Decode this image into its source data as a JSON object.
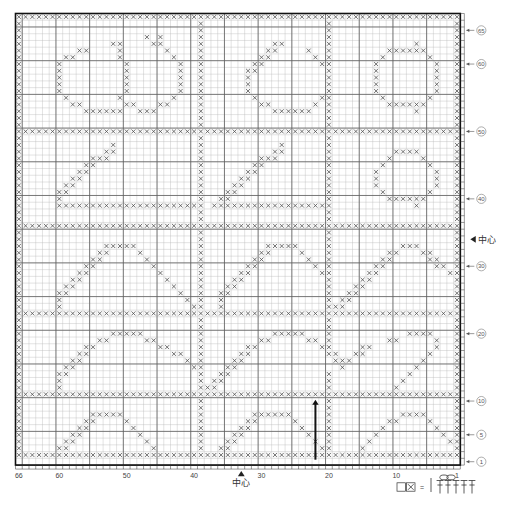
{
  "title": "",
  "chart_data": {
    "type": "heatmap",
    "xlabel": "",
    "ylabel": "",
    "grid": true,
    "cols": 66,
    "rows": 67,
    "col_numbering": "right-to-left",
    "row_numbering": "bottom-to-top",
    "major_gridline_every": 5,
    "cell_symbol": "x",
    "x_ticks": [
      {
        "col": 66,
        "label": "66"
      },
      {
        "col": 60,
        "label": "60"
      },
      {
        "col": 50,
        "label": "50"
      },
      {
        "col": 40,
        "label": "40"
      },
      {
        "col": 30,
        "label": "30"
      },
      {
        "col": 20,
        "label": "20"
      },
      {
        "col": 10,
        "label": "10"
      },
      {
        "col": 1,
        "label": "1"
      }
    ],
    "y_ticks": [
      {
        "row": 65,
        "label": "65"
      },
      {
        "row": 60,
        "label": "60"
      },
      {
        "row": 50,
        "label": "50"
      },
      {
        "row": 40,
        "label": "40"
      },
      {
        "row": 30,
        "label": "30"
      },
      {
        "row": 20,
        "label": "20"
      },
      {
        "row": 10,
        "label": "10"
      },
      {
        "row": 5,
        "label": "5"
      },
      {
        "row": 1,
        "label": "1"
      }
    ],
    "center_markers": [
      {
        "axis": "x",
        "col": 33,
        "label": "中心"
      },
      {
        "axis": "y",
        "row": 34,
        "label": "中心"
      }
    ],
    "start_arrow": {
      "col": 22,
      "label": "start",
      "direction": "up"
    },
    "rows_data": [
      "111111111111111111111111111111111111111111111111111111111111111111",
      "100000000000000000000000000100000000000000000010000000000000000001",
      "100000000000000000000000000100000000000000000010000000000000000001",
      "100000000000000000010100000100000000000000000010000000000000000001",
      "100000000000001100001100000100000000001100000010000000000001000001",
      "100000000110000100000010000100000000011000010010000000011111100001",
      "100000011000000100000001000100000000110000001010000000100000010001",
      "100000100000000010000000100100000001100000000110000001000000001001",
      "100000100000000010000000100100000011000000000010000001000000001001",
      "100000100000000010000000100100000010000000000010000001000000001001",
      "100000100000000010000000100100000010000000000010000001000000001001",
      "100000100000000010000000100100000010000000000010000001000000001001",
      "100000010000000100000001000100000001000000000110000000100000010001",
      "100000001100000011000110000100000000110000001010000000011111100001",
      "100000000011111100111000000100000000001111110010000000000001000001",
      "100000000000000000000000000100000000000000000010000000000000000001",
      "100000000000000000000000000100000000000000000010000000000000000001",
      "111111111111111111111111111111111111111111111111111111111111111111",
      "100000000000000000000000000100000000000000000010000000000000000001",
      "100000000000001000000000000100000000000100000010000000000000000001",
      "100000000000011000000000000100000000001100000010000000001111000001",
      "100000000001110000000000000100000000111000000010000000010000100001",
      "100000000011000000000000000100000001100000000010000000100000010001",
      "100000000110000000000000000100000011000000000010000001000000001001",
      "100000001100000000000000000100000110000000000010000001000000001001",
      "100000011000000000000000000100001100000000000010000001000000001001",
      "100000110000000000000000000100011000000000000010000000100000010001",
      "100000100000000000000000000100110000000000000010000000011111100001",
      "100000111111111111111111111101111111111111111110000000000001000001",
      "100000000000000000000000000100000000000000000010000000000000000001",
      "100000000000000000000000000100000000000000000010000000000000000001",
      "111111111111111111111111111111111111111111111111111111111111111111",
      "100000000000000000000000000100000000000000000010000000000000000001",
      "100000000000000000000000000100000000000000000010000000000000000001",
      "100000000000011111000000000100000000011111000010000000000111000001",
      "100000000000110000100000000100000000110000100010000000011000110001",
      "100000000001100000010000000100000001100000010010000000110000011001",
      "100000000011000000001000000100000011000000001010000001100000001101",
      "100000000110000000000100000100000110000000000110000011000000000011",
      "100000001100000000000010000100001100000000000010000110000000000001",
      "100000011000000000000001000100011000000000000010001100000000000001",
      "100000110000000000000000100100110000000000000010011000000000000001",
      "100000100000000000000000010100100000000000000010110000000000000001",
      "100000100000000000000000001100100000000000000011100000000000000001",
      "111111111111111111111111111111111111111111111111111111111111111111",
      "100000000000000000000000000100000000000000000010000000000000000001",
      "100000000000000000000000000100000000000000000010000000000000000001",
      "100000000000001111100000000100000000001111100010000000000011110001",
      "100000000000110000011000000100000000110000011010000000011000001001",
      "100000000011000000000110000100000011000000000110000110000000001001",
      "100000000110000000000001100100000110000000000011001100000000010001",
      "100000001100000000000000010100001100000000000001110000000000100001",
      "100000011000000000000000001100011000000000000000100000000001000001",
      "100000110000000000000000000100110000000000000010000000000010000001",
      "100000100000000000000000000101100000000000000010000000000100000001",
      "100000100000000000000000000111000000000000000010000000001000000001",
      "111111111111111111111111111111111111111111111111111111111111111111",
      "100000000000000000000000000100000000000000000010000000000000000001",
      "100000000000000000000000000100000000000000000010000000000000000001",
      "100000000001111100000000000100000001111110000010000000000111100001",
      "100000000011000010000000000100000011000001000010000000011000010001",
      "100000000110000001000000000100000110000000100010000000100000001001",
      "100000001100000000100000000100001100000000010010000001000000000101",
      "100000011000000000010000000100011000000000001010000010000000000011",
      "100000110000000000001000000100110000000000000110000100000000000001",
      "111111111111111111111111111111111111111111111111111111111111111111"
    ]
  },
  "legend": {
    "symbol_label": "x",
    "equals": "=",
    "description": "filet block = 3 double crochet"
  },
  "axis_labels": {
    "center_text": "中心"
  }
}
